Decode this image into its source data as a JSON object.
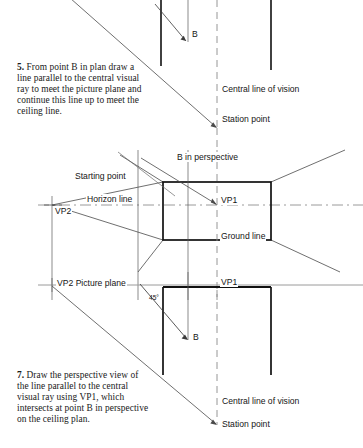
{
  "page": {
    "width": 363,
    "height": 448,
    "background": "#ffffff",
    "ink": "#1a1a1a",
    "thin_line": "#555555",
    "thick_line": "#111111",
    "dash_line": "#8a8a8a"
  },
  "instructions": [
    {
      "id": "step-5",
      "number": "5.",
      "text": "From point B in plan draw a line parallel to the central visual ray to meet the picture plane and continue this line up to meet the ceiling line."
    },
    {
      "id": "step-7",
      "number": "7.",
      "text": "Draw the perspective view of the line parallel to the central visual ray using VP1, which intersects at point B in perspective on the ceiling plan."
    }
  ],
  "labels": {
    "b_top": "B",
    "central_line_of_vision_top": "Central line of vision",
    "station_point_top": "Station point",
    "b_in_perspective": "B in perspective",
    "starting_point": "Starting point",
    "horizon_line": "Horizon line",
    "vp2_horizon": "VP2",
    "vp1_horizon": "VP1",
    "ground_line": "Ground line",
    "vp2_picture_plane": "VP2  Picture plane",
    "vp1_plan": "VP1",
    "angle_45": "45°",
    "b_bottom": "B",
    "central_line_of_vision_bottom": "Central line of vision",
    "station_point_bottom": "Station point"
  },
  "geometry": {
    "vp2_x": 52,
    "vp1_x": 217,
    "central_line_x": 217,
    "horizon_y": 205,
    "picture_plane_y": 285,
    "rect_left": 163,
    "rect_right": 271,
    "rect_top": 182,
    "rect_bottom": 240,
    "station_point_y_top": 128,
    "station_point_y_bottom": 425
  }
}
